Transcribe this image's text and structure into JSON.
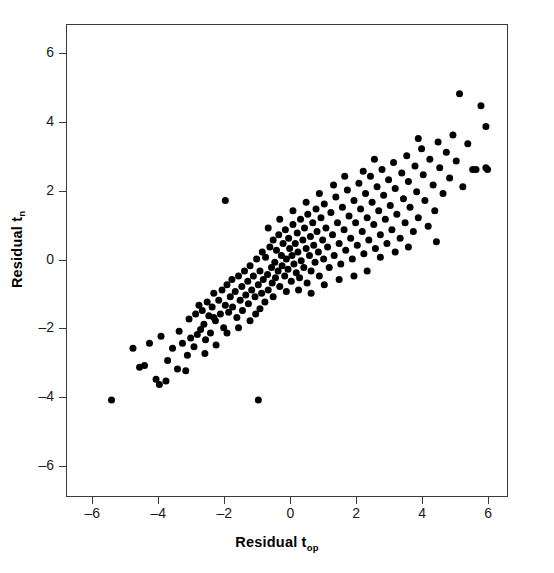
{
  "chart_data": {
    "type": "scatter",
    "title": "",
    "xlabel": "Residual t",
    "xlabel_sub": "op",
    "ylabel": "Residual t",
    "ylabel_sub": "n",
    "xlim": [
      -6.8,
      6.6
    ],
    "ylim": [
      -6.9,
      6.85
    ],
    "xticks": [
      -6,
      -4,
      -2,
      0,
      2,
      4,
      6
    ],
    "xticklabels": [
      "–6",
      "–4",
      "–2",
      "0",
      "2",
      "4",
      "6"
    ],
    "yticks": [
      6,
      4,
      2,
      0,
      -2,
      -4,
      -6
    ],
    "yticklabels": [
      "6",
      "4",
      "2",
      "0",
      "–2",
      "–4",
      "–6"
    ],
    "grid": false,
    "legend": null,
    "marker": "filled-circle",
    "marker_color": "#000000",
    "marker_size_px": 7,
    "n_points": 222,
    "correlation_approx": 0.85,
    "points": [
      [
        -5.45,
        -4.05
      ],
      [
        -4.8,
        -2.55
      ],
      [
        -4.6,
        -3.1
      ],
      [
        -4.45,
        -3.05
      ],
      [
        -4.3,
        -2.4
      ],
      [
        -4.1,
        -3.45
      ],
      [
        -4.0,
        -3.6
      ],
      [
        -3.95,
        -2.2
      ],
      [
        -3.8,
        -3.5
      ],
      [
        -3.6,
        -2.55
      ],
      [
        -3.45,
        -3.15
      ],
      [
        -3.4,
        -2.05
      ],
      [
        -3.3,
        -2.4
      ],
      [
        -3.2,
        -3.2
      ],
      [
        -3.1,
        -1.7
      ],
      [
        -3.05,
        -2.25
      ],
      [
        -2.95,
        -2.5
      ],
      [
        -2.9,
        -1.55
      ],
      [
        -2.85,
        -2.15
      ],
      [
        -2.8,
        -1.3
      ],
      [
        -2.75,
        -2.0
      ],
      [
        -2.7,
        -1.45
      ],
      [
        -2.65,
        -1.85
      ],
      [
        -2.6,
        -2.3
      ],
      [
        -2.55,
        -1.2
      ],
      [
        -2.5,
        -1.6
      ],
      [
        -2.45,
        -2.1
      ],
      [
        -2.4,
        -1.35
      ],
      [
        -2.35,
        -0.95
      ],
      [
        -2.3,
        -1.75
      ],
      [
        -2.28,
        -2.45
      ],
      [
        -2.2,
        -1.15
      ],
      [
        -2.15,
        -1.55
      ],
      [
        -2.1,
        -0.85
      ],
      [
        -2.05,
        -1.95
      ],
      [
        -2.0,
        -1.3
      ],
      [
        -2.0,
        1.75
      ],
      [
        -1.95,
        -0.7
      ],
      [
        -1.9,
        -1.5
      ],
      [
        -1.85,
        -1.05
      ],
      [
        -1.8,
        -0.55
      ],
      [
        -1.78,
        -1.35
      ],
      [
        -1.7,
        -0.9
      ],
      [
        -1.65,
        -1.65
      ],
      [
        -1.6,
        -0.45
      ],
      [
        -1.55,
        -1.15
      ],
      [
        -1.5,
        -0.75
      ],
      [
        -1.48,
        -1.45
      ],
      [
        -1.42,
        -0.3
      ],
      [
        -1.38,
        -1.0
      ],
      [
        -1.32,
        -0.6
      ],
      [
        -1.3,
        -1.25
      ],
      [
        -1.25,
        -0.15
      ],
      [
        -1.2,
        -0.85
      ],
      [
        -1.15,
        -0.45
      ],
      [
        -1.1,
        -1.05
      ],
      [
        -1.08,
        -1.55
      ],
      [
        -1.05,
        0.05
      ],
      [
        -1.0,
        -0.7
      ],
      [
        -1.0,
        -4.05
      ],
      [
        -0.95,
        -0.3
      ],
      [
        -0.9,
        -0.95
      ],
      [
        -0.88,
        0.25
      ],
      [
        -0.85,
        -0.55
      ],
      [
        -0.8,
        -1.2
      ],
      [
        -0.78,
        0.1
      ],
      [
        -0.72,
        -0.4
      ],
      [
        -0.7,
        -0.85
      ],
      [
        -0.65,
        0.4
      ],
      [
        -0.6,
        -0.2
      ],
      [
        -0.58,
        -0.65
      ],
      [
        -0.55,
        0.6
      ],
      [
        -0.5,
        -0.05
      ],
      [
        -0.48,
        -0.5
      ],
      [
        -0.45,
        0.3
      ],
      [
        -0.4,
        -0.3
      ],
      [
        -0.38,
        0.75
      ],
      [
        -0.35,
        -0.75
      ],
      [
        -0.3,
        0.15
      ],
      [
        -0.28,
        -0.15
      ],
      [
        -0.25,
        0.5
      ],
      [
        -0.2,
        -0.45
      ],
      [
        -0.18,
        0.9
      ],
      [
        -0.15,
        0.05
      ],
      [
        -0.1,
        -0.25
      ],
      [
        -0.08,
        0.65
      ],
      [
        -0.05,
        0.35
      ],
      [
        0.0,
        -0.6
      ],
      [
        0.02,
        0.15
      ],
      [
        0.05,
        1.05
      ],
      [
        0.08,
        -0.1
      ],
      [
        0.12,
        0.5
      ],
      [
        0.15,
        -0.35
      ],
      [
        0.18,
        0.8
      ],
      [
        0.2,
        0.25
      ],
      [
        0.25,
        -0.5
      ],
      [
        0.28,
        1.2
      ],
      [
        0.3,
        0.0
      ],
      [
        0.35,
        0.6
      ],
      [
        0.38,
        -0.2
      ],
      [
        0.4,
        0.95
      ],
      [
        0.45,
        0.35
      ],
      [
        0.48,
        -0.65
      ],
      [
        0.5,
        1.35
      ],
      [
        0.55,
        0.15
      ],
      [
        0.58,
        0.7
      ],
      [
        0.6,
        -0.3
      ],
      [
        0.65,
        1.1
      ],
      [
        0.68,
        0.45
      ],
      [
        0.72,
        -0.05
      ],
      [
        0.75,
        1.5
      ],
      [
        0.78,
        0.85
      ],
      [
        0.82,
        0.25
      ],
      [
        0.85,
        -0.45
      ],
      [
        0.9,
        1.25
      ],
      [
        0.95,
        0.6
      ],
      [
        0.98,
        0.05
      ],
      [
        1.0,
        1.65
      ],
      [
        1.05,
        0.95
      ],
      [
        1.1,
        0.4
      ],
      [
        1.15,
        -0.2
      ],
      [
        1.2,
        1.4
      ],
      [
        1.25,
        0.75
      ],
      [
        1.3,
        0.15
      ],
      [
        1.35,
        1.85
      ],
      [
        1.4,
        1.1
      ],
      [
        1.45,
        0.5
      ],
      [
        1.5,
        -0.1
      ],
      [
        1.55,
        1.55
      ],
      [
        1.6,
        0.9
      ],
      [
        1.65,
        0.3
      ],
      [
        1.7,
        2.05
      ],
      [
        1.75,
        1.3
      ],
      [
        1.8,
        0.65
      ],
      [
        1.85,
        0.05
      ],
      [
        1.9,
        1.75
      ],
      [
        1.95,
        1.1
      ],
      [
        2.0,
        0.45
      ],
      [
        2.05,
        2.25
      ],
      [
        2.1,
        1.5
      ],
      [
        2.15,
        0.85
      ],
      [
        2.2,
        0.2
      ],
      [
        2.25,
        1.95
      ],
      [
        2.3,
        1.25
      ],
      [
        2.35,
        0.6
      ],
      [
        2.4,
        2.45
      ],
      [
        2.45,
        1.7
      ],
      [
        2.5,
        1.05
      ],
      [
        2.55,
        0.35
      ],
      [
        2.6,
        2.15
      ],
      [
        2.65,
        1.45
      ],
      [
        2.7,
        0.75
      ],
      [
        2.75,
        2.65
      ],
      [
        2.8,
        1.9
      ],
      [
        2.85,
        1.2
      ],
      [
        2.9,
        0.5
      ],
      [
        2.95,
        2.35
      ],
      [
        3.0,
        1.6
      ],
      [
        3.05,
        0.9
      ],
      [
        3.1,
        2.85
      ],
      [
        3.15,
        2.1
      ],
      [
        3.2,
        1.35
      ],
      [
        3.3,
        0.65
      ],
      [
        3.35,
        2.55
      ],
      [
        3.4,
        1.8
      ],
      [
        3.45,
        1.1
      ],
      [
        3.5,
        3.05
      ],
      [
        3.55,
        2.3
      ],
      [
        3.6,
        1.55
      ],
      [
        3.7,
        0.85
      ],
      [
        3.75,
        2.75
      ],
      [
        3.8,
        2.0
      ],
      [
        3.85,
        1.25
      ],
      [
        3.95,
        3.25
      ],
      [
        4.0,
        2.5
      ],
      [
        4.05,
        1.75
      ],
      [
        4.15,
        1.0
      ],
      [
        4.2,
        2.95
      ],
      [
        4.3,
        2.2
      ],
      [
        4.35,
        1.45
      ],
      [
        4.45,
        3.45
      ],
      [
        4.5,
        2.7
      ],
      [
        4.6,
        1.95
      ],
      [
        4.7,
        3.15
      ],
      [
        4.8,
        2.4
      ],
      [
        4.9,
        3.65
      ],
      [
        5.0,
        2.9
      ],
      [
        5.1,
        4.85
      ],
      [
        5.2,
        2.15
      ],
      [
        5.35,
        3.4
      ],
      [
        5.5,
        2.65
      ],
      [
        5.6,
        2.65
      ],
      [
        5.75,
        4.5
      ],
      [
        5.9,
        3.9
      ],
      [
        5.95,
        2.65
      ],
      [
        5.9,
        2.7
      ],
      [
        -3.75,
        -2.9
      ],
      [
        -3.15,
        -2.75
      ],
      [
        -2.62,
        -2.7
      ],
      [
        -2.35,
        -1.65
      ],
      [
        -1.95,
        -2.1
      ],
      [
        -1.6,
        -1.95
      ],
      [
        -1.25,
        -1.75
      ],
      [
        -0.95,
        -1.4
      ],
      [
        -0.55,
        -1.05
      ],
      [
        -0.15,
        -0.9
      ],
      [
        0.22,
        -0.85
      ],
      [
        0.6,
        -0.95
      ],
      [
        1.0,
        -0.7
      ],
      [
        1.45,
        -0.55
      ],
      [
        1.9,
        -0.45
      ],
      [
        2.3,
        -0.3
      ],
      [
        2.7,
        0.1
      ],
      [
        3.15,
        0.25
      ],
      [
        3.55,
        0.4
      ],
      [
        4.4,
        0.55
      ],
      [
        1.28,
        2.2
      ],
      [
        1.62,
        2.45
      ],
      [
        2.18,
        2.6
      ],
      [
        2.52,
        2.95
      ],
      [
        0.85,
        1.95
      ],
      [
        0.45,
        1.7
      ],
      [
        0.05,
        1.45
      ],
      [
        -0.35,
        1.2
      ],
      [
        -0.7,
        0.95
      ],
      [
        3.85,
        3.55
      ]
    ]
  }
}
